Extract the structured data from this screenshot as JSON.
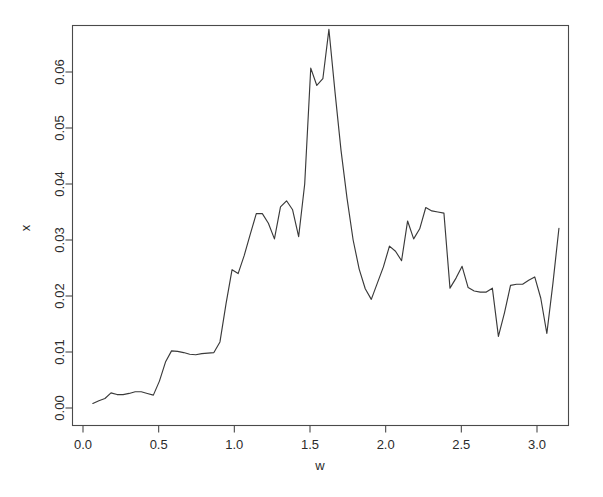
{
  "chart_data": {
    "type": "line",
    "title": "",
    "xlabel": "w",
    "ylabel": "x",
    "xlim": [
      -0.03,
      3.22
    ],
    "ylim": [
      -0.0015,
      0.0695
    ],
    "grid": false,
    "legend": "none",
    "xticks": [
      0.0,
      0.5,
      1.0,
      1.5,
      2.0,
      2.5,
      3.0
    ],
    "xticklabels": [
      "0.0",
      "0.5",
      "1.0",
      "1.5",
      "2.0",
      "2.5",
      "3.0"
    ],
    "yticks": [
      0.0,
      0.01,
      0.02,
      0.03,
      0.04,
      0.05,
      0.06
    ],
    "yticklabels": [
      "0.00",
      "0.01",
      "0.02",
      "0.03",
      "0.04",
      "0.05",
      "0.06"
    ],
    "line_color": "#3a3a3a",
    "series": [
      {
        "name": "spectrum",
        "x": [
          0.065,
          0.105,
          0.145,
          0.185,
          0.225,
          0.265,
          0.305,
          0.345,
          0.385,
          0.425,
          0.465,
          0.505,
          0.545,
          0.585,
          0.625,
          0.665,
          0.705,
          0.745,
          0.785,
          0.825,
          0.865,
          0.905,
          0.945,
          0.985,
          1.025,
          1.065,
          1.105,
          1.145,
          1.185,
          1.225,
          1.265,
          1.305,
          1.345,
          1.385,
          1.425,
          1.465,
          1.505,
          1.545,
          1.585,
          1.625,
          1.665,
          1.705,
          1.745,
          1.785,
          1.825,
          1.865,
          1.905,
          1.945,
          1.985,
          2.025,
          2.065,
          2.105,
          2.145,
          2.185,
          2.225,
          2.265,
          2.305,
          2.345,
          2.385,
          2.425,
          2.465,
          2.505,
          2.545,
          2.585,
          2.625,
          2.665,
          2.705,
          2.745,
          2.785,
          2.825,
          2.865,
          2.905,
          2.945,
          2.985,
          3.025,
          3.065,
          3.105,
          3.145
        ],
        "values": [
          0.0008,
          0.0013,
          0.0017,
          0.0027,
          0.0024,
          0.0024,
          0.0026,
          0.0029,
          0.0029,
          0.0026,
          0.0023,
          0.0048,
          0.0082,
          0.0102,
          0.0101,
          0.0099,
          0.0096,
          0.0095,
          0.0097,
          0.0098,
          0.0099,
          0.0118,
          0.0186,
          0.0247,
          0.024,
          0.0272,
          0.031,
          0.0347,
          0.0347,
          0.033,
          0.0302,
          0.0359,
          0.037,
          0.0354,
          0.0306,
          0.04,
          0.0607,
          0.0576,
          0.0588,
          0.0676,
          0.0565,
          0.046,
          0.0374,
          0.03,
          0.0248,
          0.0213,
          0.0194,
          0.0223,
          0.0252,
          0.0289,
          0.028,
          0.0263,
          0.0334,
          0.0302,
          0.032,
          0.0358,
          0.0352,
          0.035,
          0.0348,
          0.0214,
          0.0232,
          0.0253,
          0.0215,
          0.0209,
          0.0207,
          0.0207,
          0.0214,
          0.0128,
          0.017,
          0.0219,
          0.0221,
          0.0221,
          0.0228,
          0.0234,
          0.0196,
          0.0133,
          0.0222,
          0.0321
        ]
      }
    ]
  },
  "axes": {
    "x_title": "w",
    "y_title": "x"
  }
}
